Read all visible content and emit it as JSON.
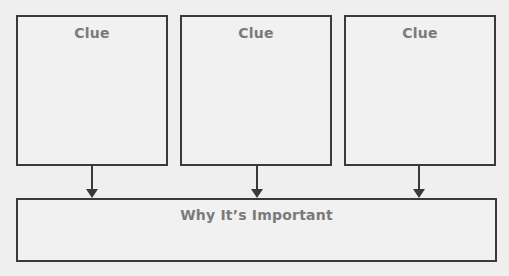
{
  "diagram": {
    "clues": [
      {
        "label": "Clue"
      },
      {
        "label": "Clue"
      },
      {
        "label": "Clue"
      }
    ],
    "result": {
      "label": "Why It’s Important"
    },
    "arrows": [
      {
        "from": "clue-1",
        "to": "result"
      },
      {
        "from": "clue-2",
        "to": "result"
      },
      {
        "from": "clue-3",
        "to": "result"
      }
    ],
    "colors": {
      "background": "#efefef",
      "border": "#3a3a3a",
      "label_text": "#7a7a7a"
    }
  }
}
